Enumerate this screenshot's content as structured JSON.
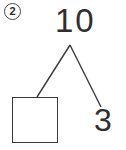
{
  "problem": {
    "number_label": "2",
    "type": "number-bond",
    "whole": "10",
    "parts": [
      {
        "kind": "blank",
        "value": ""
      },
      {
        "kind": "given",
        "value": "3"
      }
    ],
    "answer": "7"
  },
  "colors": {
    "background": "#ffffff",
    "ink": "#2f2f2f",
    "line": "#3a3a3a",
    "circle": "#4a4a4a"
  },
  "geometry": {
    "apex": {
      "x": 70,
      "y": 45
    },
    "left_end": {
      "x": 37,
      "y": 97
    },
    "right_end": {
      "x": 101,
      "y": 107
    }
  }
}
